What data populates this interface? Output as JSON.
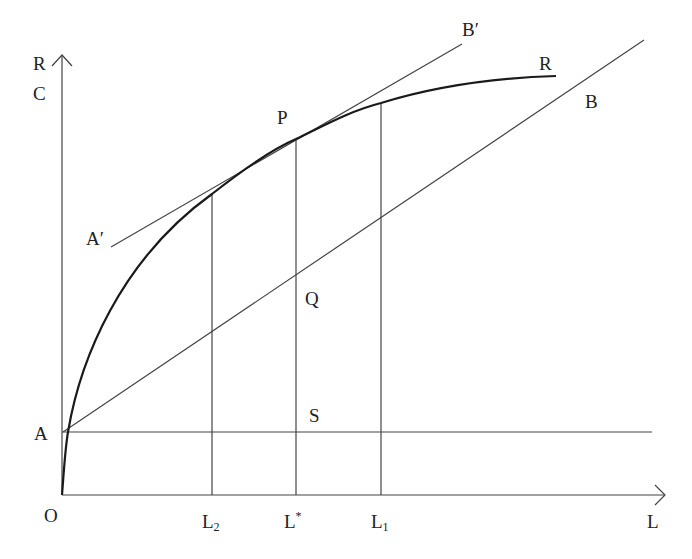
{
  "diagram": {
    "type": "economics-production-curve",
    "axes": {
      "y_label_top": "R",
      "y_label_bottom": "C",
      "x_label": "L",
      "origin_label": "O"
    },
    "curves": {
      "revenue_curve_label": "R",
      "cost_line_label": "B",
      "tangent_start_label": "A′",
      "tangent_end_label": "B′"
    },
    "points": {
      "A": "A",
      "P": "P",
      "Q": "Q",
      "S": "S"
    },
    "x_ticks": {
      "L2": {
        "main": "L",
        "sub": "2"
      },
      "Lstar": {
        "main": "L",
        "sup": "*"
      },
      "L1": {
        "main": "L",
        "sub": "1"
      }
    }
  }
}
